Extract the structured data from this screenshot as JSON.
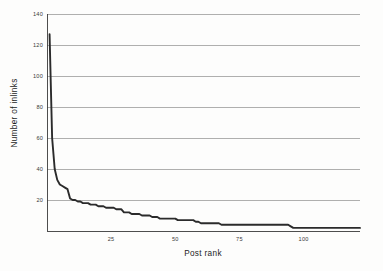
{
  "figure": {
    "background_color": "#fdfdfc",
    "line_color": "#2b2b2b",
    "grid_color": "#8d8d8d",
    "axis_color": "#3b3b3b"
  },
  "axes": {
    "x_title": "Post rank",
    "y_title": "Number of inlinks",
    "x_tick_labels": [
      "25",
      "50",
      "75",
      "100"
    ],
    "y_tick_labels": [
      "20",
      "40",
      "60",
      "80",
      "100",
      "120",
      "140"
    ]
  },
  "chart_data": {
    "type": "line",
    "title": "",
    "xlabel": "Post rank",
    "ylabel": "Number of inlinks",
    "xlim": [
      0,
      122
    ],
    "ylim": [
      0,
      140
    ],
    "xticks": [
      25,
      50,
      75,
      100
    ],
    "yticks": [
      20,
      40,
      60,
      80,
      100,
      120,
      140
    ],
    "grid": "horizontal",
    "legend": "none",
    "series": [
      {
        "name": "Number of inlinks",
        "x": [
          1,
          2,
          3,
          4,
          5,
          6,
          7,
          8,
          9,
          10,
          11,
          12,
          13,
          14,
          15,
          16,
          17,
          18,
          19,
          20,
          21,
          22,
          23,
          24,
          25,
          26,
          27,
          28,
          29,
          30,
          31,
          32,
          33,
          34,
          35,
          36,
          37,
          38,
          39,
          40,
          41,
          42,
          43,
          44,
          45,
          46,
          47,
          48,
          49,
          50,
          51,
          52,
          53,
          54,
          55,
          56,
          57,
          58,
          59,
          60,
          61,
          62,
          63,
          64,
          65,
          66,
          67,
          68,
          69,
          70,
          71,
          72,
          73,
          74,
          75,
          76,
          77,
          78,
          79,
          80,
          81,
          82,
          83,
          84,
          85,
          86,
          87,
          88,
          89,
          90,
          91,
          92,
          93,
          94,
          95,
          96,
          97,
          98,
          99,
          100,
          101,
          102,
          103,
          104,
          105,
          106,
          107,
          108,
          109,
          110,
          111,
          112,
          113,
          114,
          115,
          116,
          117,
          118,
          119,
          120,
          121,
          122
        ],
        "y": [
          127,
          60,
          40,
          33,
          30,
          29,
          28,
          27,
          21,
          20,
          20,
          19,
          19,
          18,
          18,
          18,
          17,
          17,
          17,
          16,
          16,
          16,
          15,
          15,
          15,
          15,
          14,
          14,
          14,
          12,
          12,
          12,
          11,
          11,
          11,
          11,
          10,
          10,
          10,
          10,
          9,
          9,
          9,
          8,
          8,
          8,
          8,
          8,
          8,
          8,
          7,
          7,
          7,
          7,
          7,
          7,
          7,
          6,
          6,
          5,
          5,
          5,
          5,
          5,
          5,
          5,
          5,
          4,
          4,
          4,
          4,
          4,
          4,
          4,
          4,
          4,
          4,
          4,
          4,
          4,
          4,
          4,
          4,
          4,
          4,
          4,
          4,
          4,
          4,
          4,
          4,
          4,
          4,
          4,
          3,
          2,
          2,
          2,
          2,
          2,
          2,
          2,
          2,
          2,
          2,
          2,
          2,
          2,
          2,
          2,
          2,
          2,
          2,
          2,
          2,
          2,
          2,
          2,
          2,
          2,
          2,
          2
        ]
      }
    ]
  }
}
